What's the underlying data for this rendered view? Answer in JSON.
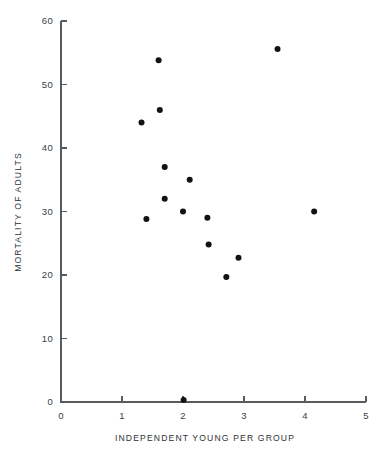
{
  "chart_data": {
    "type": "scatter",
    "title": "",
    "xlabel": "INDEPENDENT  YOUNG  PER  GROUP",
    "ylabel": "MORTALITY  OF  ADULTS",
    "xlim": [
      0,
      5
    ],
    "ylim": [
      0,
      60
    ],
    "xticks": [
      0,
      1,
      2,
      3,
      4,
      5
    ],
    "yticks": [
      0,
      10,
      20,
      30,
      40,
      50,
      60
    ],
    "xtick_labels": [
      "0",
      "1",
      "2",
      "3",
      "4",
      "5"
    ],
    "ytick_labels": [
      "0",
      "10",
      "20",
      "30",
      "40",
      "50",
      "60"
    ],
    "grid": false,
    "legend": false,
    "marker": "filled-circle",
    "marker_color": "#121212",
    "marker_size": 5.2,
    "axis_color": "#555b5e",
    "background": "#ffffff",
    "points": [
      {
        "x": 1.32,
        "y": 44.0
      },
      {
        "x": 1.4,
        "y": 28.8
      },
      {
        "x": 1.6,
        "y": 53.8
      },
      {
        "x": 1.62,
        "y": 46.0
      },
      {
        "x": 1.7,
        "y": 37.0
      },
      {
        "x": 1.7,
        "y": 32.0
      },
      {
        "x": 2.0,
        "y": 30.0
      },
      {
        "x": 2.01,
        "y": 0.3
      },
      {
        "x": 2.11,
        "y": 35.0
      },
      {
        "x": 2.4,
        "y": 29.0
      },
      {
        "x": 2.42,
        "y": 24.8
      },
      {
        "x": 2.71,
        "y": 19.7
      },
      {
        "x": 2.91,
        "y": 22.7
      },
      {
        "x": 3.55,
        "y": 55.6
      },
      {
        "x": 4.15,
        "y": 30.0
      }
    ]
  }
}
